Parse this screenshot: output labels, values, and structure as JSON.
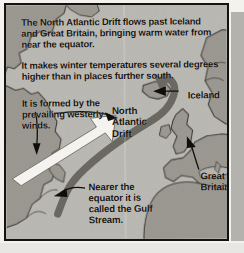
{
  "figure": {
    "kind": "textbook-map-diagram",
    "title_text": "The North Atlantic Drift",
    "colors": {
      "page": "#f3f2ee",
      "ocean": "#b9b7b1",
      "land": "#9d9a93",
      "land_outline": "#3a3731",
      "current": "#6b6862",
      "wind_arrow": "#f4f3ef",
      "text": "#16140f",
      "frame": "#15130f",
      "pointer_arrow": "#100e0a"
    }
  },
  "captions": {
    "intro_p1": "The North Atlantic Drift flows past Iceland and Great Britain, bringing warm water from near the equator.",
    "intro_p2": "It makes winter temperatures several degrees higher than in places further south.",
    "wind": "It is formed by the prevailing westerly winds.",
    "gulf": "Nearer the equator it is called the Gulf Stream."
  },
  "map_labels": {
    "north_atlantic_drift": "North Atlantic Drift",
    "iceland": "Iceland",
    "great_britain": "Great Britain"
  },
  "icons": {
    "pointer_iceland": "leader-arrow-left-icon",
    "pointer_nad": "leader-arrow-right-icon",
    "pointer_gb": "leader-arrow-up-left-icon",
    "pointer_gulf": "leader-arrow-left-icon",
    "pointer_wind": "leader-arrow-down-icon",
    "wind_arrow": "block-arrow-northeast-icon",
    "current_arrow": "ocean-current-arrow-icon"
  }
}
